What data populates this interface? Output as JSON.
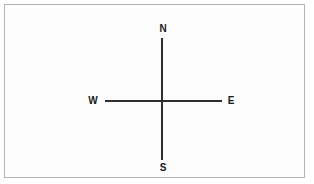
{
  "diagram": {
    "name": "compass-directions",
    "type": "cardinal-direction-cross",
    "background_color": "#ffffff",
    "border_color": "#b4b4b4",
    "line_color": "#2f2f2f",
    "label_color": "#1a1a1a",
    "labels": {
      "north": "N",
      "south": "S",
      "west": "W",
      "east": "E"
    },
    "axes": {
      "vertical_label_top": "N",
      "vertical_label_bottom": "S",
      "horizontal_label_left": "W",
      "horizontal_label_right": "E"
    }
  },
  "chart_data": {
    "type": "scatter",
    "title": "",
    "xlabel": "",
    "ylabel": "",
    "grid": false,
    "legend": "none",
    "annotations": [
      "N",
      "S",
      "W",
      "E"
    ],
    "series": [
      {
        "name": "vertical-axis",
        "x": [
          0,
          0
        ],
        "y": [
          1,
          -1
        ]
      },
      {
        "name": "horizontal-axis",
        "x": [
          -1,
          1
        ],
        "y": [
          0,
          0
        ]
      }
    ],
    "xlim": [
      -1.2,
      1.2
    ],
    "ylim": [
      -1.2,
      1.2
    ]
  }
}
